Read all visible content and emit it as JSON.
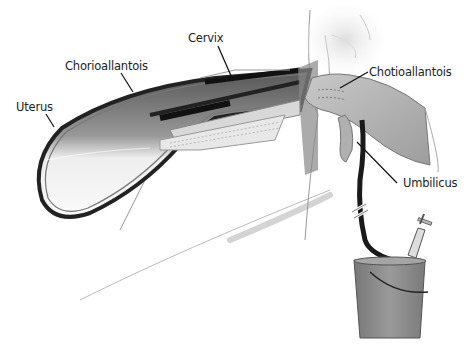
{
  "figure": {
    "labels": {
      "cervix": "Cervix",
      "chorioallantois": "Chorioallantois",
      "uterus": "Uterus",
      "chotioallantois": "Chotioallantois",
      "umbilicus": "Umbilicus"
    }
  },
  "colors": {
    "outline": "#2a2a2a",
    "membrane_dark": "#1e1e1e",
    "tissue_gray": "#9a9a9a",
    "skin": "#b5b5b5",
    "bucket": "#8c8c8c",
    "background": "#ffffff"
  }
}
